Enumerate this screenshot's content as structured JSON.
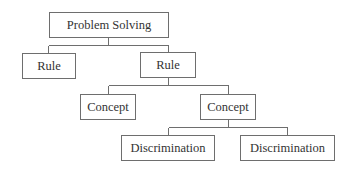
{
  "diagram": {
    "type": "hierarchy-tree",
    "nodes": [
      {
        "id": "problem-solving",
        "label": "Problem Solving",
        "level": 0
      },
      {
        "id": "rule-left",
        "label": "Rule",
        "level": 1
      },
      {
        "id": "rule-right",
        "label": "Rule",
        "level": 1
      },
      {
        "id": "concept-left",
        "label": "Concept",
        "level": 2
      },
      {
        "id": "concept-right",
        "label": "Concept",
        "level": 2
      },
      {
        "id": "discrimination-left",
        "label": "Discrimination",
        "level": 3
      },
      {
        "id": "discrimination-right",
        "label": "Discrimination",
        "level": 3
      }
    ],
    "edges": [
      [
        "problem-solving",
        "rule-left"
      ],
      [
        "problem-solving",
        "rule-right"
      ],
      [
        "rule-right",
        "concept-left"
      ],
      [
        "rule-right",
        "concept-right"
      ],
      [
        "concept-right",
        "discrimination-left"
      ],
      [
        "concept-right",
        "discrimination-right"
      ]
    ],
    "colors": {
      "line": "#6e6e6e",
      "text": "#333333",
      "background": "#ffffff"
    }
  }
}
